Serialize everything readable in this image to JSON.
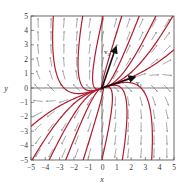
{
  "chart_data": {
    "type": "line",
    "title": "",
    "subtitle": "Phase portrait / direction field with solution curves",
    "xlabel": "x",
    "ylabel": "y",
    "xlim": [
      -5,
      5
    ],
    "ylim": [
      -5,
      5
    ],
    "x_ticks": [
      -5,
      -4,
      -3,
      -2,
      -1,
      0,
      1,
      2,
      3,
      4,
      5
    ],
    "y_ticks": [
      -5,
      -4,
      -3,
      -2,
      -1,
      0,
      1,
      2,
      3,
      4,
      5
    ],
    "grid": false,
    "legend": null,
    "annotations": [
      {
        "label": "v1",
        "from": [
          0,
          0
        ],
        "to": [
          2.4,
          0.8
        ]
      },
      {
        "label": "v2",
        "from": [
          0,
          0
        ],
        "to": [
          1.0,
          2.9
        ]
      }
    ],
    "series_color": "#b01c2e",
    "vector_color": "#111111",
    "arrow_color": "#555555",
    "note": "Solution trajectories emanate from the origin (unstable node); direction field arrows shown on a grid."
  },
  "axis": {
    "xlabel": "x",
    "ylabel": "y",
    "x_tick_labels": [
      "−5",
      "−4",
      "−3",
      "−2",
      "−1",
      "0",
      "1",
      "2",
      "3",
      "4",
      "5"
    ],
    "y_tick_labels": [
      "5",
      "4",
      "3",
      "2",
      "1",
      "0",
      "−1",
      "−2",
      "−3",
      "−4",
      "−5"
    ]
  },
  "vectors": {
    "v1_label": "v",
    "v1_sub": "1",
    "v2_label": "v",
    "v2_sub": "2"
  }
}
